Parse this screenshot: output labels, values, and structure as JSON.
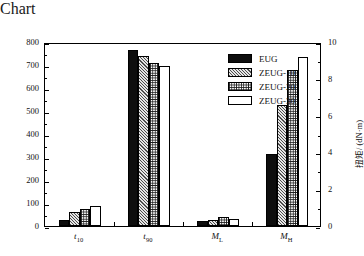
{
  "chart_data": {
    "type": "bar",
    "title": "",
    "subtitle": "",
    "categories": [
      "t10",
      "t90",
      "ML",
      "MH"
    ],
    "category_labels_html": [
      "t<sub>10</sub>",
      "t<sub>90</sub>",
      "M<sub>L</sub>",
      "M<sub>H</sub>"
    ],
    "series": [
      {
        "name": "EUG",
        "pattern": "solid",
        "values": [
          25,
          765,
          20,
          315
        ]
      },
      {
        "name": "ZEUG-10",
        "pattern": "diagonal-hatch",
        "values": [
          60,
          740,
          28,
          525
        ]
      },
      {
        "name": "ZEUG-20",
        "pattern": "checkerboard",
        "values": [
          75,
          707,
          38,
          680
        ]
      },
      {
        "name": "ZEUG-30",
        "pattern": "empty",
        "values": [
          85,
          697,
          30,
          735
        ]
      }
    ],
    "axes": {
      "left": {
        "label": "时间/s",
        "ticks": [
          0,
          100,
          200,
          300,
          400,
          500,
          600,
          700,
          800
        ],
        "minor_ticks": [
          50,
          150,
          250,
          350,
          450,
          550,
          650,
          750
        ],
        "range": [
          0,
          800
        ],
        "applies_to": [
          "t10",
          "t90"
        ]
      },
      "right": {
        "label": "扭矩/ (dN·m)",
        "ticks": [
          0,
          2,
          4,
          6,
          8,
          10
        ],
        "minor_ticks": [
          1,
          3,
          5,
          7,
          9
        ],
        "range": [
          0,
          10
        ],
        "applies_to": [
          "ML",
          "MH"
        ]
      },
      "bottom": {
        "label": "",
        "ticks": [
          "t10",
          "t90",
          "ML",
          "MH"
        ]
      }
    },
    "grid": false,
    "legend": {
      "position": "top-right-inside",
      "entries": [
        "EUG",
        "ZEUG-10",
        "ZEUG-20",
        "ZEUG-30"
      ]
    },
    "colors": {
      "series_solid": "#0d0d0d",
      "series_hatch": "#c8c8c8",
      "series_check": "#ffffff",
      "series_empty": "#ffffff",
      "axis": "#000000",
      "background": "#ffffff"
    }
  },
  "legend": {
    "items": [
      {
        "label": "EUG"
      },
      {
        "label": "ZEUG-10"
      },
      {
        "label": "ZEUG-20"
      },
      {
        "label": "ZEUG-30"
      }
    ]
  },
  "axis_left": {
    "title": "时间/s",
    "tick_labels": [
      "800",
      "700",
      "600",
      "500",
      "400",
      "300",
      "200",
      "100",
      "0"
    ]
  },
  "axis_right": {
    "title": "扭矩/ (dN·m)",
    "tick_labels": [
      "10",
      "8",
      "6",
      "4",
      "2",
      "0"
    ]
  }
}
